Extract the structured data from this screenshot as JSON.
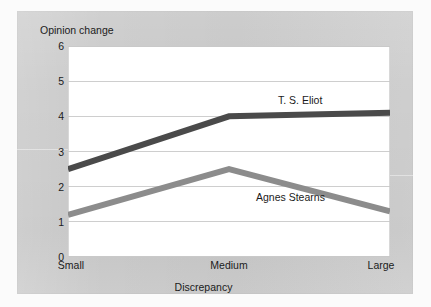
{
  "figure": {
    "panel_color": "#c9c9c9",
    "plot_background": "#ffffff",
    "gridline_color": "#c9c9c9"
  },
  "chart_data": {
    "type": "line",
    "title": "",
    "xlabel": "Discrepancy",
    "ylabel": "Opinion change",
    "categories": [
      "Small",
      "Medium",
      "Large"
    ],
    "ylim": [
      0,
      6
    ],
    "yticks": [
      0,
      1,
      2,
      3,
      4,
      5,
      6
    ],
    "ytick_labels": [
      "0",
      "1",
      "2",
      "3",
      "4",
      "5",
      "6"
    ],
    "grid": true,
    "grid_axis": "y",
    "legend_position": "inline-annotations",
    "series": [
      {
        "name": "T. S. Eliot",
        "values": [
          2.5,
          4.0,
          4.1
        ],
        "color": "#4a4a4a",
        "linewidth": 6
      },
      {
        "name": "Agnes Stearns",
        "values": [
          1.2,
          2.5,
          1.3
        ],
        "color": "#8c8c8c",
        "linewidth": 6
      }
    ],
    "annotations": [
      {
        "text": "T. S. Eliot",
        "series": "T. S. Eliot"
      },
      {
        "text": "Agnes Stearns",
        "series": "Agnes Stearns"
      }
    ]
  }
}
